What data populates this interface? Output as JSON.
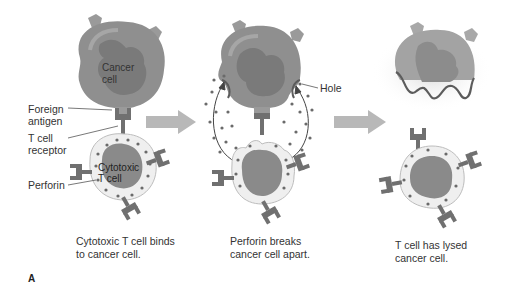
{
  "panel_letter": "A",
  "colors": {
    "cancer_cell_body": "#8f8f8f",
    "cancer_cell_nucleus": "#7a7a7a",
    "cancer_cell_highlight": "#a6a6a6",
    "receptor": "#707070",
    "antigen": "#9a9a9a",
    "t_cell_body": "#efefef",
    "t_cell_nucleus": "#8a8a8a",
    "perforin_dot": "#6a6a6a",
    "arrow": "#b8b8b8",
    "membrane_damage": "#5c5c5c"
  },
  "steps": [
    {
      "caption_line1": "Cytotoxic T cell binds",
      "caption_line2": "to cancer cell.",
      "labels": {
        "cancer_cell_line1": "Cancer",
        "cancer_cell_line2": "cell",
        "foreign_antigen_line1": "Foreign",
        "foreign_antigen_line2": "antigen",
        "t_cell_receptor_line1": "T cell",
        "t_cell_receptor_line2": "receptor",
        "perforin": "Perforin",
        "cytotoxic_line1": "Cytotoxic",
        "cytotoxic_line2": "T cell"
      }
    },
    {
      "caption_line1": "Perforin breaks",
      "caption_line2": "cancer cell apart.",
      "labels": {
        "hole": "Hole"
      }
    },
    {
      "caption_line1": "T cell has lysed",
      "caption_line2": "cancer cell."
    }
  ]
}
